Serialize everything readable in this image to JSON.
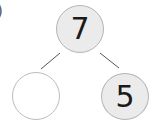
{
  "problem": {
    "label_fragment": ")"
  },
  "number_bond": {
    "whole": {
      "value": "7",
      "fill": "#ebebeb"
    },
    "parts": [
      {
        "position": "left",
        "value": "",
        "fill": "#ffffff"
      },
      {
        "position": "right",
        "value": "5",
        "fill": "#ebebeb"
      }
    ],
    "connector_color": "#555555"
  }
}
